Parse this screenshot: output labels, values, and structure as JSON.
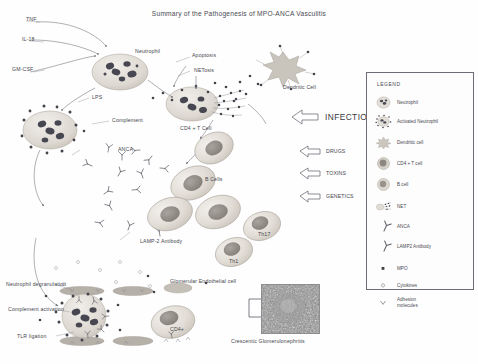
{
  "title": "Summary of the Pathogenesis of MPO-ANCA Vasculitis",
  "stimuli": [
    {
      "key": "tnf",
      "label": "TNF"
    },
    {
      "key": "il18",
      "label": "IL-18"
    },
    {
      "key": "gmcsf",
      "label": "GM-CSF"
    },
    {
      "key": "lps",
      "label": "LPS"
    },
    {
      "key": "compl",
      "label": "Complement"
    }
  ],
  "cell_labels": [
    {
      "key": "neutrophil",
      "label": "Neutrophil"
    },
    {
      "key": "apoptosis",
      "label": "Apoptosis"
    },
    {
      "key": "netosis",
      "label": "NETosis"
    },
    {
      "key": "dendritic",
      "label": "Dendritic Cell"
    },
    {
      "key": "cd4tcell",
      "label": "CD4 + T Cell"
    },
    {
      "key": "anca",
      "label": "ANCA"
    },
    {
      "key": "bcells",
      "label": "B Cells"
    },
    {
      "key": "lamp2",
      "label": "LAMP-2\nAntibody"
    },
    {
      "key": "th17",
      "label": "Th17"
    },
    {
      "key": "th1",
      "label": "Th1"
    },
    {
      "key": "glomendo",
      "label": "Glomerular Endothelial cell"
    },
    {
      "key": "cd4plus",
      "label": "CD4+"
    }
  ],
  "triggers": [
    {
      "key": "infection",
      "label": "INFECTION"
    },
    {
      "key": "drugs",
      "label": "DRUGS"
    },
    {
      "key": "toxins",
      "label": "TOXINS"
    },
    {
      "key": "genetics",
      "label": "GENETICS"
    }
  ],
  "effector_labels": [
    {
      "key": "degranulation",
      "label": "Neutrophil\ndegranulation"
    },
    {
      "key": "complement_act",
      "label": "Complement\nactivation"
    },
    {
      "key": "tlr",
      "label": "TLR ligation"
    }
  ],
  "outcome": {
    "caption": "Crescentic Glomerulonephritis"
  },
  "legend": {
    "title": "LEGEND",
    "items": [
      {
        "key": "neutrophil",
        "label": "Neutrophil"
      },
      {
        "key": "activated-neutrophil",
        "label": "Activated Neutrophil"
      },
      {
        "key": "dendritic-cell",
        "label": "Dendritic cell"
      },
      {
        "key": "cd4-t-cell",
        "label": "CD4 + T cell"
      },
      {
        "key": "b-cell",
        "label": "B cell"
      },
      {
        "key": "net",
        "label": "NET"
      },
      {
        "key": "anca",
        "label": "ANCA"
      },
      {
        "key": "lamp2-antibody",
        "label": "LAMP2 Antibody"
      },
      {
        "key": "mpo",
        "label": "MPO"
      },
      {
        "key": "cytokines",
        "label": "Cytokines"
      },
      {
        "key": "adhesion-molecules",
        "label": "Adhesion\nmolecules"
      }
    ]
  },
  "colors": {
    "background": "#fefefe",
    "ink": "#46464e",
    "cell_fill": "#ded9d2",
    "cell_edge": "#a9a49c",
    "nucleus": "#8f8a84",
    "granule": "#4c4c55",
    "arrow_stroke": "#6e6e78",
    "legend_border": "#6d6d75",
    "histology": "#8a8a8a"
  }
}
